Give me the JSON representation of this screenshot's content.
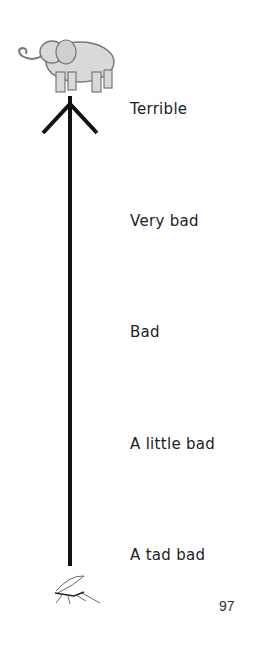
{
  "scale": {
    "top_icon": "elephant-icon",
    "bottom_icon": "mosquito-icon",
    "levels": [
      {
        "label": "Terrible"
      },
      {
        "label": "Very bad"
      },
      {
        "label": "Bad"
      },
      {
        "label": "A little bad"
      },
      {
        "label": "A tad bad"
      }
    ]
  },
  "page_number": "97",
  "colors": {
    "arrow": "#111111",
    "text": "#222222",
    "background": "#ffffff"
  }
}
